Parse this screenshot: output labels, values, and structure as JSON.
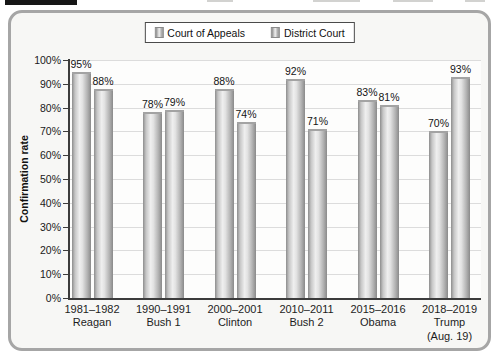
{
  "chart_data": {
    "type": "bar",
    "title": "",
    "xlabel": "",
    "ylabel": "Confirmation rate",
    "ylim": [
      0,
      100
    ],
    "grid": true,
    "legend_position": "top-center",
    "value_label_suffix": "%",
    "y_ticks": [
      "0%",
      "10%",
      "20%",
      "30%",
      "40%",
      "50%",
      "60%",
      "70%",
      "80%",
      "90%",
      "100%"
    ],
    "categories": [
      {
        "period": "1981–1982",
        "president": "Reagan"
      },
      {
        "period": "1990–1991",
        "president": "Bush 1"
      },
      {
        "period": "2000–2001",
        "president": "Clinton"
      },
      {
        "period": "2010–2011",
        "president": "Bush 2"
      },
      {
        "period": "2015–2016",
        "president": "Obama"
      },
      {
        "period": "2018–2019",
        "president": "Trump",
        "note": "(Aug. 19)"
      }
    ],
    "series": [
      {
        "name": "Court of Appeals",
        "values": [
          95,
          78,
          88,
          92,
          83,
          70
        ]
      },
      {
        "name": "District Court",
        "values": [
          88,
          79,
          74,
          71,
          81,
          93
        ]
      }
    ]
  },
  "colors": {
    "panel_border": "#a6a6a6",
    "grid": "#dcdcdc",
    "axis": "#3c3c3c",
    "bar_dark": "#8a8a8a",
    "bar_light": "#efefef",
    "label_text": "#141414"
  }
}
